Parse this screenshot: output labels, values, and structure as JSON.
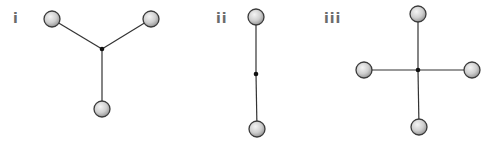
{
  "figure": {
    "panels": [
      {
        "id": "i",
        "label": "i",
        "label_pos": [
          13,
          11
        ],
        "center": [
          102,
          49
        ],
        "atoms": [
          [
            52,
            19
          ],
          [
            151,
            19
          ],
          [
            102,
            109
          ]
        ]
      },
      {
        "id": "ii",
        "label": "ii",
        "label_pos": [
          216,
          11
        ],
        "center": [
          256,
          74
        ],
        "atoms": [
          [
            256,
            17
          ],
          [
            257,
            129
          ]
        ]
      },
      {
        "id": "iii",
        "label": "iii",
        "label_pos": [
          324,
          11
        ],
        "center": [
          418,
          70
        ],
        "atoms": [
          [
            418,
            14
          ],
          [
            364,
            70
          ],
          [
            472,
            70
          ],
          [
            419,
            127
          ]
        ]
      }
    ],
    "style": {
      "bond_color": "#333333",
      "center_dot_color": "#111111",
      "atom_fill_light": "#f2f2f2",
      "atom_fill_dark": "#9a9a9a",
      "atom_stroke": "#3a3a3a",
      "atom_radius": 8,
      "center_dot_radius": 2.3
    }
  }
}
